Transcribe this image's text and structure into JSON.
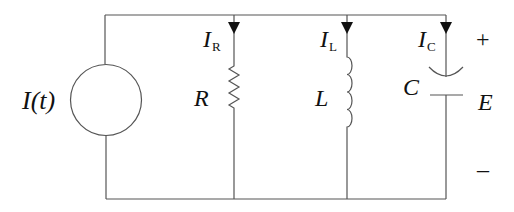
{
  "diagram": {
    "type": "parallel RLC circuit",
    "source": {
      "label": "I(t)"
    },
    "branches": [
      {
        "component": "resistor",
        "label": "R",
        "current": {
          "main": "I",
          "sub": "R"
        }
      },
      {
        "component": "inductor",
        "label": "L",
        "current": {
          "main": "I",
          "sub": "L"
        }
      },
      {
        "component": "capacitor",
        "label": "C",
        "current": {
          "main": "I",
          "sub": "C"
        }
      }
    ],
    "voltage": {
      "label": "E",
      "plus": "+",
      "minus": "–"
    },
    "colors": {
      "wire": "#555555",
      "text": "#111111",
      "background": "#ffffff"
    }
  }
}
